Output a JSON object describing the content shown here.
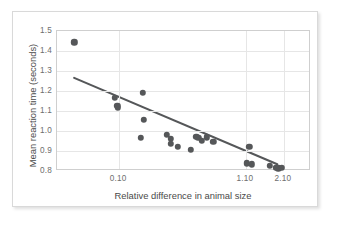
{
  "chart_data": {
    "type": "scatter",
    "title": "",
    "xlabel": "Relative difference in animal size",
    "ylabel": "Mean reaction time (seconds)",
    "xticks": [
      "0.10",
      "1.10",
      "2.10"
    ],
    "xtick_positions": [
      0.245,
      0.744,
      0.893
    ],
    "yticks": [
      "1.5",
      "1.4",
      "1.3",
      "1.2",
      "1.1",
      "1.0",
      "0.9",
      "0.8"
    ],
    "ylim": [
      0.8,
      1.5
    ],
    "grid": true,
    "legend": null,
    "point_color": "#555759",
    "line_color": "#555759",
    "points": [
      {
        "px": 0.068,
        "y": 1.444
      },
      {
        "px": 0.228,
        "y": 1.167
      },
      {
        "px": 0.237,
        "y": 1.126
      },
      {
        "px": 0.24,
        "y": 1.115
      },
      {
        "px": 0.338,
        "y": 1.191
      },
      {
        "px": 0.341,
        "y": 1.055
      },
      {
        "px": 0.33,
        "y": 0.966
      },
      {
        "px": 0.432,
        "y": 0.981
      },
      {
        "px": 0.447,
        "y": 0.961
      },
      {
        "px": 0.449,
        "y": 0.936
      },
      {
        "px": 0.476,
        "y": 0.921
      },
      {
        "px": 0.527,
        "y": 0.906
      },
      {
        "px": 0.549,
        "y": 0.972
      },
      {
        "px": 0.556,
        "y": 0.966
      },
      {
        "px": 0.571,
        "y": 0.951
      },
      {
        "px": 0.589,
        "y": 0.968
      },
      {
        "px": 0.616,
        "y": 0.946
      },
      {
        "px": 0.757,
        "y": 0.92
      },
      {
        "px": 0.747,
        "y": 0.838
      },
      {
        "px": 0.766,
        "y": 0.833
      },
      {
        "px": 0.838,
        "y": 0.826
      },
      {
        "px": 0.861,
        "y": 0.817
      },
      {
        "px": 0.872,
        "y": 0.813
      },
      {
        "px": 0.884,
        "y": 0.816
      }
    ],
    "trendline": {
      "x_start": 0.068,
      "y_start": 1.262,
      "x_end": 0.874,
      "y_end": 0.824
    }
  }
}
